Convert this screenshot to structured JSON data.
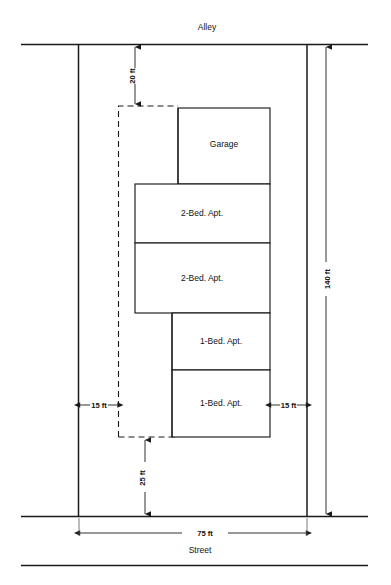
{
  "diagram": {
    "type": "site-plan"
  },
  "edges": {
    "top_label": "Alley",
    "bottom_label": "Street"
  },
  "buildings": [
    {
      "id": "garage",
      "label": "Garage",
      "x": 178,
      "y": 108,
      "w": 92,
      "h": 76
    },
    {
      "id": "two-bed-1",
      "label": "2-Bed. Apt.",
      "x": 135,
      "y": 184,
      "w": 135,
      "h": 59
    },
    {
      "id": "two-bed-2",
      "label": "2-Bed. Apt.",
      "x": 135,
      "y": 243,
      "w": 135,
      "h": 70
    },
    {
      "id": "one-bed-1",
      "label": "1-Bed. Apt.",
      "x": 172,
      "y": 313,
      "w": 98,
      "h": 57
    },
    {
      "id": "one-bed-2",
      "label": "1-Bed. Apt.",
      "x": 172,
      "y": 370,
      "w": 98,
      "h": 67
    }
  ],
  "dimensions": {
    "front_setback": {
      "label": "20 ft",
      "orientation": "vertical"
    },
    "rear_setback": {
      "label": "25 ft",
      "orientation": "vertical"
    },
    "side_left": {
      "label": "15 ft",
      "orientation": "horizontal"
    },
    "side_right": {
      "label": "15 ft",
      "orientation": "horizontal"
    },
    "lot_depth": {
      "label": "140 ft",
      "orientation": "vertical"
    },
    "lot_width": {
      "label": "75 ft",
      "orientation": "horizontal"
    }
  },
  "colors": {
    "ink": "#1a1a1a",
    "paper": "#ffffff"
  }
}
